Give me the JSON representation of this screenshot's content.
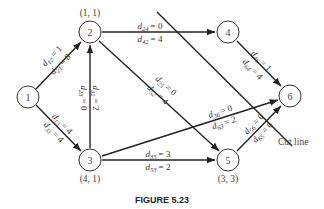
{
  "figure": {
    "caption": "FIGURE 5.23",
    "cut_line_label": "Cut line"
  },
  "nodes": [
    {
      "id": "1",
      "label": "1",
      "coord": ""
    },
    {
      "id": "2",
      "label": "2",
      "coord": "(1, 1)"
    },
    {
      "id": "3",
      "label": "3",
      "coord": "(4, 1)"
    },
    {
      "id": "4",
      "label": "4",
      "coord": ""
    },
    {
      "id": "5",
      "label": "5",
      "coord": "(3, 3)"
    },
    {
      "id": "6",
      "label": "6",
      "coord": ""
    }
  ],
  "edges": [
    {
      "from": "1",
      "to": "2",
      "top": {
        "d": "d",
        "sub": "12",
        "val": "= 1"
      },
      "bottom": {
        "d": "d",
        "sub": "21",
        "val": "= 8"
      }
    },
    {
      "from": "1",
      "to": "3",
      "top": {
        "d": "d",
        "sub": "13",
        "val": "= 4"
      },
      "bottom": {
        "d": "d",
        "sub": "31",
        "val": "= 4"
      }
    },
    {
      "from": "3",
      "to": "2",
      "top": {
        "d": "d",
        "sub": "23",
        "val": "= 0"
      },
      "bottom": {
        "d": "d",
        "sub": "32",
        "val": "= 2"
      }
    },
    {
      "from": "2",
      "to": "4",
      "top": {
        "d": "d",
        "sub": "24",
        "val": "= 0"
      },
      "bottom": {
        "d": "d",
        "sub": "42",
        "val": "= 4"
      }
    },
    {
      "from": "2",
      "to": "5",
      "top": {
        "d": "d",
        "sub": "25",
        "val": "= 0"
      },
      "bottom": {
        "d": "d",
        "sub": "52",
        "val": "= 4"
      }
    },
    {
      "from": "4",
      "to": "6",
      "top": {
        "d": "d",
        "sub": "46",
        "val": "= 1"
      },
      "bottom": {
        "d": "d",
        "sub": "64",
        "val": "= 4"
      }
    },
    {
      "from": "3",
      "to": "6",
      "top": {
        "d": "d",
        "sub": "36",
        "val": "= 0"
      },
      "bottom": {
        "d": "d",
        "sub": "63",
        "val": "= 2"
      }
    },
    {
      "from": "3",
      "to": "5",
      "top": {
        "d": "d",
        "sub": "35",
        "val": "= 3"
      },
      "bottom": {
        "d": "d",
        "sub": "53",
        "val": "= 2"
      }
    },
    {
      "from": "5",
      "to": "6",
      "top": {
        "d": "d",
        "sub": "56",
        "val": "= 0"
      },
      "bottom": {
        "d": "d",
        "sub": "65",
        "val": "= 6"
      }
    }
  ]
}
